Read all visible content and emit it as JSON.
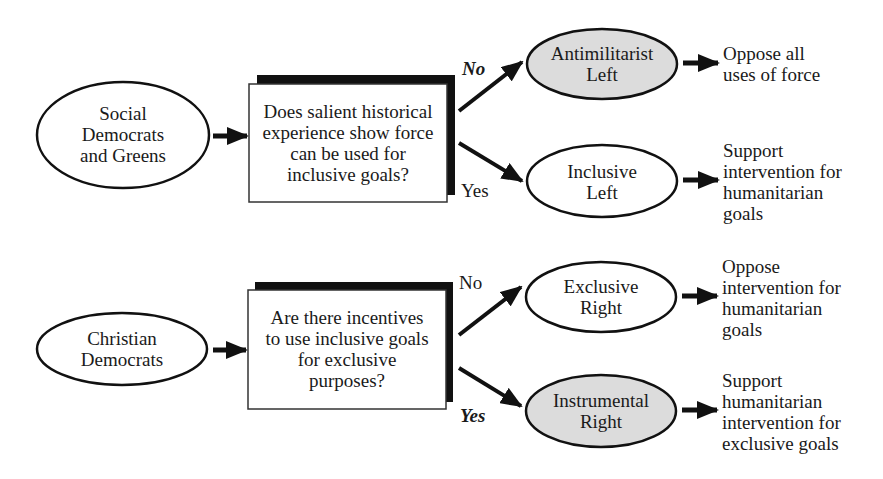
{
  "colors": {
    "stroke": "#111111",
    "shaded_fill": "#dcdcdc",
    "plain_fill": "#ffffff",
    "shadow": "#111111"
  },
  "diagram": {
    "flows": [
      {
        "source": {
          "label": "Social\nDemocrats\nand Greens"
        },
        "question": {
          "label": "Does salient historical\nexperience show force\ncan be used for\ninclusive goals?"
        },
        "branches": [
          {
            "answer": "No",
            "emphasis": true,
            "outcome": {
              "label": "Antimilitarist\nLeft",
              "shaded": true
            },
            "policy": "Oppose all\nuses of force"
          },
          {
            "answer": "Yes",
            "emphasis": false,
            "outcome": {
              "label": "Inclusive\nLeft",
              "shaded": false
            },
            "policy": "Support\nintervention for\nhumanitarian\ngoals"
          }
        ]
      },
      {
        "source": {
          "label": "Christian\nDemocrats"
        },
        "question": {
          "label": "Are there incentives\nto use inclusive goals\nfor exclusive\npurposes?"
        },
        "branches": [
          {
            "answer": "No",
            "emphasis": false,
            "outcome": {
              "label": "Exclusive\nRight",
              "shaded": false
            },
            "policy": "Oppose\nintervention for\nhumanitarian\ngoals"
          },
          {
            "answer": "Yes",
            "emphasis": true,
            "outcome": {
              "label": "Instrumental\nRight",
              "shaded": true
            },
            "policy": "Support\nhumanitarian\nintervention for\nexclusive goals"
          }
        ]
      }
    ]
  }
}
